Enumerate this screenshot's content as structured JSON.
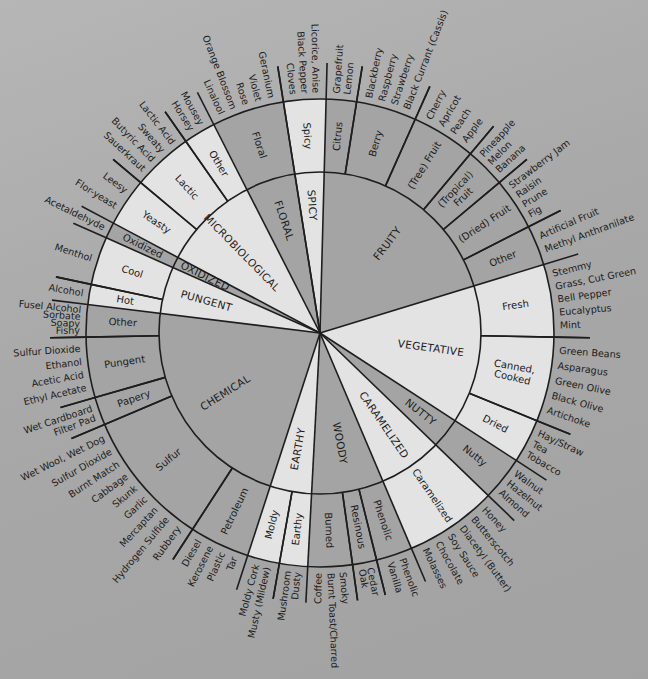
{
  "wheel": {
    "center": [
      320,
      333
    ],
    "radii": {
      "inner": 161,
      "outer": 234,
      "label": 236
    },
    "colors": {
      "background": "#a9a9a9",
      "dark": "#a4a4a4",
      "light": "#e3e3e3",
      "line": "#1e1e1e",
      "text": "#1c1c1c"
    },
    "categories": [
      {
        "name": "SPICY",
        "start": -9,
        "end": 1.5,
        "shade": "light",
        "sub": [
          {
            "name": "Spicy",
            "start": -9,
            "end": 1.5,
            "shade": "light",
            "terms": [
              "Cloves",
              "Black Pepper",
              "Licorice, Anise"
            ]
          }
        ]
      },
      {
        "name": "FRUITY",
        "start": 1.5,
        "end": 73,
        "shade": "dark",
        "sub": [
          {
            "name": "Citrus",
            "start": 1.5,
            "end": 9,
            "shade": "dark",
            "terms": [
              "Grapefruit",
              "Lemon"
            ]
          },
          {
            "name": "Berry",
            "start": 9,
            "end": 24,
            "shade": "dark",
            "terms": [
              "Blackberry",
              "Raspberry",
              "Strawberry",
              "Black Currant (Cassis)"
            ]
          },
          {
            "name": "(Tree) Fruit",
            "start": 24,
            "end": 40,
            "shade": "dark",
            "terms": [
              "Cherry",
              "Apricot",
              "Peach",
              "Apple"
            ]
          },
          {
            "name": "(Tropical) Fruit",
            "start": 40,
            "end": 50,
            "shade": "dark",
            "terms": [
              "Pineapple",
              "Melon",
              "Banana"
            ]
          },
          {
            "name": "(Dried) Fruit",
            "start": 50,
            "end": 63,
            "shade": "dark",
            "terms": [
              "Strawberry Jam",
              "Raisin",
              "Prune",
              "Fig"
            ]
          },
          {
            "name": "Other",
            "start": 63,
            "end": 73,
            "shade": "dark",
            "terms": [
              "Artificial Fruit",
              "Methyl Anthranilate"
            ]
          }
        ]
      },
      {
        "name": "VEGETATIVE",
        "start": 73,
        "end": 123,
        "shade": "light",
        "sub": [
          {
            "name": "Fresh",
            "start": 73,
            "end": 91,
            "shade": "light",
            "terms": [
              "Stemmy",
              "Grass, Cut Green",
              "Bell Pepper",
              "Eucalyptus",
              "Mint"
            ]
          },
          {
            "name": "Canned, Cooked",
            "start": 91,
            "end": 112,
            "shade": "light",
            "terms": [
              "Green Beans",
              "Asparagus",
              "Green Olive",
              "Black Olive",
              "Artichoke"
            ]
          },
          {
            "name": "Dried",
            "start": 112,
            "end": 123,
            "shade": "light",
            "terms": [
              "Hay/Straw",
              "Tea",
              "Tobacco"
            ]
          }
        ]
      },
      {
        "name": "NUTTY",
        "start": 123,
        "end": 134,
        "shade": "dark",
        "sub": [
          {
            "name": "Nutty",
            "start": 123,
            "end": 134,
            "shade": "dark",
            "terms": [
              "Walnut",
              "Hazelnut",
              "Almond"
            ]
          }
        ]
      },
      {
        "name": "CARAMELIZED",
        "start": 134,
        "end": 157,
        "shade": "light",
        "sub": [
          {
            "name": "Caramelized",
            "start": 134,
            "end": 157,
            "shade": "light",
            "terms": [
              "Honey",
              "Butterscotch",
              "Diacetyl (Butter)",
              "Soy Sauce",
              "Chocolate",
              "Molasses"
            ]
          }
        ]
      },
      {
        "name": "WOODY",
        "start": 157,
        "end": 183,
        "shade": "dark",
        "sub": [
          {
            "name": "Phenolic",
            "start": 157,
            "end": 166,
            "shade": "dark",
            "terms": [
              "Phenolic",
              "Vanilla"
            ]
          },
          {
            "name": "Resinous",
            "start": 166,
            "end": 172,
            "shade": "dark",
            "terms": [
              "Cedar",
              "Oak"
            ]
          },
          {
            "name": "Burned",
            "start": 172,
            "end": 183,
            "shade": "dark",
            "terms": [
              "Smoky",
              "Burnt Toast/Charred",
              "Coffee"
            ]
          }
        ]
      },
      {
        "name": "EARTHY",
        "start": 183,
        "end": 198,
        "shade": "light",
        "sub": [
          {
            "name": "Earthy",
            "start": 183,
            "end": 190,
            "shade": "light",
            "terms": [
              "Dusty",
              "Mushroom"
            ]
          },
          {
            "name": "Moldy",
            "start": 190,
            "end": 198,
            "shade": "light",
            "terms": [
              "Musty (Mildew)",
              "Moldy Cork"
            ]
          }
        ]
      },
      {
        "name": "CHEMICAL",
        "start": 198,
        "end": 277,
        "shade": "dark",
        "sub": [
          {
            "name": "Petroleum",
            "start": 198,
            "end": 213,
            "shade": "dark",
            "terms": [
              "Tar",
              "Plastic",
              "Kerosene",
              "Diesel"
            ]
          },
          {
            "name": "Sulfur",
            "start": 213,
            "end": 247,
            "shade": "dark",
            "terms": [
              "Rubbery",
              "Hydrogen Sulfide",
              "Mercaptan",
              "Garlic",
              "Skunk",
              "Cabbage",
              "Burnt Match",
              "Sulfur Dioxide",
              "Wet Wool, Wet Dog"
            ]
          },
          {
            "name": "Papery",
            "start": 247,
            "end": 254,
            "shade": "dark",
            "terms": [
              "Filter Pad",
              "Wet Cardboard"
            ]
          },
          {
            "name": "Pungent",
            "start": 254,
            "end": 269,
            "shade": "dark",
            "terms": [
              "Ethyl Acetate",
              "Acetic Acid",
              "Ethanol",
              "Sulfur Dioxide"
            ]
          },
          {
            "name": "Other",
            "start": 269,
            "end": 277,
            "shade": "dark",
            "terms": [
              "Fishy",
              "Soapy",
              "Sorbate",
              "Fusel Alcohol"
            ]
          }
        ]
      },
      {
        "name": "PUNGENT",
        "start": 277,
        "end": 294,
        "shade": "light",
        "sub": [
          {
            "name": "Hot",
            "start": 277,
            "end": 282,
            "shade": "light",
            "terms": [
              "Alcohol"
            ]
          },
          {
            "name": "Cool",
            "start": 282,
            "end": 294,
            "shade": "light",
            "terms": [
              "Menthol"
            ]
          }
        ]
      },
      {
        "name": "OXIDIZED",
        "start": 294,
        "end": 298,
        "shade": "dark",
        "sub": [
          {
            "name": "Oxidized",
            "start": 294,
            "end": 298,
            "shade": "dark",
            "terms": [
              "Acetaldehyde"
            ]
          }
        ]
      },
      {
        "name": "MICROBIOLOGICAL",
        "start": 298,
        "end": 333,
        "shade": "light",
        "sub": [
          {
            "name": "Yeasty",
            "start": 298,
            "end": 310,
            "shade": "light",
            "terms": [
              "Flor-yeast",
              "Leesy"
            ]
          },
          {
            "name": "Lactic",
            "start": 310,
            "end": 325,
            "shade": "light",
            "terms": [
              "Sauerkraut",
              "Butyric Acid",
              "Sweaty",
              "Lactic Acid"
            ]
          },
          {
            "name": "Other",
            "start": 325,
            "end": 333,
            "shade": "light",
            "terms": [
              "Horsey",
              "Mousey"
            ]
          }
        ]
      },
      {
        "name": "FLORAL",
        "start": 333,
        "end": 351,
        "shade": "dark",
        "sub": [
          {
            "name": "Floral",
            "start": 333,
            "end": 351,
            "shade": "dark",
            "terms": [
              "Linalool",
              "Orange Blossom",
              "Rose",
              "Violet",
              "Geranium"
            ]
          }
        ]
      }
    ]
  }
}
